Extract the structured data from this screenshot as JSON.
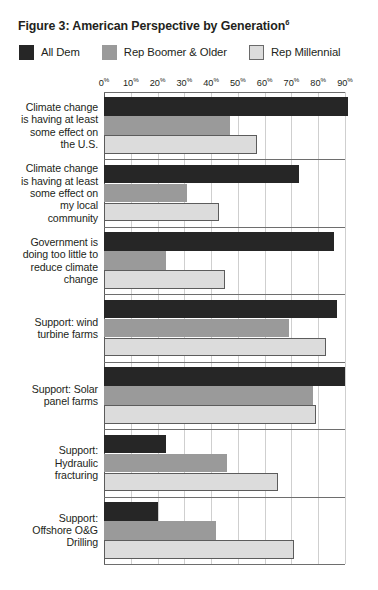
{
  "figure": {
    "title": "Figure 3: American Perspective by Generation",
    "title_superscript": "6"
  },
  "legend": {
    "position": "top",
    "items": [
      {
        "label": "All Dem",
        "color": "#262626",
        "swatch": "dark"
      },
      {
        "label": "Rep Boomer & Older",
        "color": "#9a9a9a",
        "swatch": "mid"
      },
      {
        "label": "Rep Millennial",
        "color": "#dcdcdc",
        "swatch": "light"
      }
    ]
  },
  "chart_data": {
    "type": "bar",
    "orientation": "horizontal",
    "title": "Figure 3: American Perspective by Generation",
    "xlabel": "",
    "ylabel": "",
    "xlim": [
      0,
      90
    ],
    "grid": true,
    "legend_position": "top",
    "tick_labels": [
      "0%",
      "10%",
      "20%",
      "30%",
      "40%",
      "50%",
      "60%",
      "70%",
      "80%",
      "90%"
    ],
    "tick_values": [
      0,
      10,
      20,
      30,
      40,
      50,
      60,
      70,
      80,
      90
    ],
    "categories": [
      "Climate change is having at least some effect on the U.S.",
      "Climate change is having at least some effect on my local community",
      "Government is doing too little to reduce climate change",
      "Support: wind turbine farms",
      "Support: Solar panel farms",
      "Support: Hydraulic fracturing",
      "Support: Offshore O&G Drilling"
    ],
    "category_lines": [
      [
        "Climate change",
        "is having at least",
        "some effect on",
        "the U.S."
      ],
      [
        "Climate change",
        "is having at least",
        "some effect on",
        "my local",
        "community"
      ],
      [
        "Government is",
        "doing too little to",
        "reduce climate",
        "change"
      ],
      [
        "Support: wind",
        "turbine farms"
      ],
      [
        "Support: Solar",
        "panel farms"
      ],
      [
        "Support:",
        "Hydraulic",
        "fracturing"
      ],
      [
        "Support:",
        "Offshore O&G",
        "Drilling"
      ]
    ],
    "series": [
      {
        "name": "All Dem",
        "color": "#262626",
        "values": [
          91,
          73,
          86,
          87,
          90,
          23,
          20
        ]
      },
      {
        "name": "Rep Boomer & Older",
        "color": "#9a9a9a",
        "values": [
          47,
          31,
          23,
          69,
          78,
          46,
          42
        ]
      },
      {
        "name": "Rep Millennial",
        "color": "#dcdcdc",
        "values": [
          57,
          43,
          45,
          83,
          79,
          65,
          71
        ]
      }
    ]
  }
}
